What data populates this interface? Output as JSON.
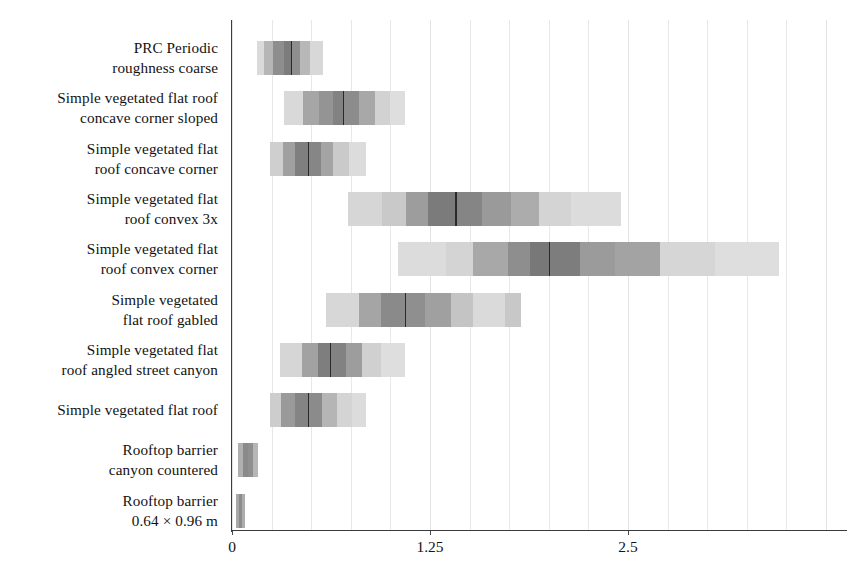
{
  "chart_data": {
    "type": "bar",
    "title": "",
    "xlabel": "",
    "ylabel": "",
    "orientation": "horizontal",
    "xlim": [
      -0.09,
      3.78
    ],
    "grid": true,
    "grid_axis": "x",
    "legend": "none",
    "xticks": [
      {
        "value": 0,
        "label": "0"
      },
      {
        "value": 1.25,
        "label": "1.25"
      },
      {
        "value": 2.5,
        "label": "2.5"
      }
    ],
    "minor_gridline_step": 0.25,
    "categories": [
      "PRC Periodic roughness coarse",
      "Simple vegetated flat roof concave corner sloped",
      "Simple vegetated flat roof concave corner",
      "Simple vegetated flat roof convex 3x",
      "Simple vegetated flat roof convex corner",
      "Simple vegetated flat roof gabled",
      "Simple vegetated flat roof angled street canyon",
      "Simple vegetated flat roof",
      "Rooftop barrier canyon countered",
      "Rooftop barrier 0.64 × 0.96 m"
    ],
    "category_labels": [
      {
        "line1": "PRC Periodic",
        "line2": "roughness coarse"
      },
      {
        "line1": "Simple vegetated flat roof",
        "line2": "concave corner sloped"
      },
      {
        "line1": "Simple vegetated flat",
        "line2": "roof concave corner"
      },
      {
        "line1": "Simple vegetated flat",
        "line2": "roof convex 3x"
      },
      {
        "line1": "Simple vegetated flat",
        "line2": "roof convex corner"
      },
      {
        "line1": "Simple vegetated",
        "line2": "flat roof gabled"
      },
      {
        "line1": "Simple vegetated flat",
        "line2": "roof angled street canyon"
      },
      {
        "line1": "Simple vegetated flat roof",
        "line2": ""
      },
      {
        "line1": "Rooftop barrier",
        "line2": "canyon countered"
      },
      {
        "line1": "Rooftop barrier",
        "line2": "0.64 × 0.96 m"
      }
    ],
    "series": [
      {
        "name": "density distribution",
        "rows": [
          {
            "category": "PRC Periodic roughness coarse",
            "min": 0.16,
            "max": 0.57,
            "median": 0.37,
            "bands": [
              {
                "from": 0.16,
                "to": 0.2,
                "shade": "#dadada"
              },
              {
                "from": 0.2,
                "to": 0.26,
                "shade": "#b6b6b6"
              },
              {
                "from": 0.26,
                "to": 0.33,
                "shade": "#8e8e8e"
              },
              {
                "from": 0.33,
                "to": 0.37,
                "shade": "#7c7c7c"
              },
              {
                "from": 0.37,
                "to": 0.43,
                "shade": "#8e8e8e"
              },
              {
                "from": 0.43,
                "to": 0.49,
                "shade": "#b8b8b8"
              },
              {
                "from": 0.49,
                "to": 0.57,
                "shade": "#d8d8d8"
              }
            ]
          },
          {
            "category": "Simple vegetated flat roof concave corner sloped",
            "min": 0.33,
            "max": 1.09,
            "median": 0.7,
            "bands": [
              {
                "from": 0.33,
                "to": 0.45,
                "shade": "#d9d9d9"
              },
              {
                "from": 0.45,
                "to": 0.55,
                "shade": "#a6a6a6"
              },
              {
                "from": 0.55,
                "to": 0.64,
                "shade": "#949494"
              },
              {
                "from": 0.64,
                "to": 0.7,
                "shade": "#828282"
              },
              {
                "from": 0.7,
                "to": 0.8,
                "shade": "#8c8c8c"
              },
              {
                "from": 0.8,
                "to": 0.9,
                "shade": "#a8a8a8"
              },
              {
                "from": 0.9,
                "to": 1.0,
                "shade": "#d2d2d2"
              },
              {
                "from": 1.0,
                "to": 1.09,
                "shade": "#dedede"
              }
            ]
          },
          {
            "category": "Simple vegetated flat roof concave corner",
            "min": 0.24,
            "max": 0.84,
            "median": 0.48,
            "bands": [
              {
                "from": 0.24,
                "to": 0.32,
                "shade": "#cfcfcf"
              },
              {
                "from": 0.32,
                "to": 0.4,
                "shade": "#a0a0a0"
              },
              {
                "from": 0.4,
                "to": 0.48,
                "shade": "#7f7f7f"
              },
              {
                "from": 0.48,
                "to": 0.56,
                "shade": "#868686"
              },
              {
                "from": 0.56,
                "to": 0.64,
                "shade": "#a4a4a4"
              },
              {
                "from": 0.64,
                "to": 0.74,
                "shade": "#cacaca"
              },
              {
                "from": 0.74,
                "to": 0.84,
                "shade": "#dcdcdc"
              }
            ]
          },
          {
            "category": "Simple vegetated flat roof convex 3x",
            "min": 0.73,
            "max": 2.45,
            "median": 1.41,
            "bands": [
              {
                "from": 0.73,
                "to": 0.95,
                "shade": "#d6d6d6"
              },
              {
                "from": 0.95,
                "to": 1.1,
                "shade": "#c9c9c9"
              },
              {
                "from": 1.1,
                "to": 1.24,
                "shade": "#9d9d9d"
              },
              {
                "from": 1.24,
                "to": 1.41,
                "shade": "#7b7b7b"
              },
              {
                "from": 1.41,
                "to": 1.58,
                "shade": "#858585"
              },
              {
                "from": 1.58,
                "to": 1.76,
                "shade": "#9a9a9a"
              },
              {
                "from": 1.76,
                "to": 1.94,
                "shade": "#acacac"
              },
              {
                "from": 1.94,
                "to": 2.14,
                "shade": "#d4d4d4"
              },
              {
                "from": 2.14,
                "to": 2.45,
                "shade": "#dcdcdc"
              }
            ]
          },
          {
            "category": "Simple vegetated flat roof convex corner",
            "min": 1.05,
            "max": 3.45,
            "median": 2.0,
            "bands": [
              {
                "from": 1.05,
                "to": 1.35,
                "shade": "#dcdcdc"
              },
              {
                "from": 1.35,
                "to": 1.52,
                "shade": "#d4d4d4"
              },
              {
                "from": 1.52,
                "to": 1.74,
                "shade": "#a8a8a8"
              },
              {
                "from": 1.74,
                "to": 1.88,
                "shade": "#8e8e8e"
              },
              {
                "from": 1.88,
                "to": 2.0,
                "shade": "#787878"
              },
              {
                "from": 2.0,
                "to": 2.2,
                "shade": "#7d7d7d"
              },
              {
                "from": 2.2,
                "to": 2.42,
                "shade": "#9b9b9b"
              },
              {
                "from": 2.42,
                "to": 2.7,
                "shade": "#a3a3a3"
              },
              {
                "from": 2.7,
                "to": 3.05,
                "shade": "#d6d6d6"
              },
              {
                "from": 3.05,
                "to": 3.45,
                "shade": "#dedede"
              }
            ]
          },
          {
            "category": "Simple vegetated flat roof gabled",
            "min": 0.59,
            "max": 1.82,
            "median": 1.09,
            "bands": [
              {
                "from": 0.59,
                "to": 0.8,
                "shade": "#d7d7d7"
              },
              {
                "from": 0.8,
                "to": 0.94,
                "shade": "#a5a5a5"
              },
              {
                "from": 0.94,
                "to": 1.09,
                "shade": "#8a8a8a"
              },
              {
                "from": 1.09,
                "to": 1.22,
                "shade": "#8f8f8f"
              },
              {
                "from": 1.22,
                "to": 1.38,
                "shade": "#a0a0a0"
              },
              {
                "from": 1.38,
                "to": 1.52,
                "shade": "#c4c4c4"
              },
              {
                "from": 1.52,
                "to": 1.72,
                "shade": "#dadada"
              },
              {
                "from": 1.72,
                "to": 1.82,
                "shade": "#c8c8c8"
              }
            ]
          },
          {
            "category": "Simple vegetated flat roof angled street canyon",
            "min": 0.3,
            "max": 1.09,
            "median": 0.62,
            "bands": [
              {
                "from": 0.3,
                "to": 0.44,
                "shade": "#d6d6d6"
              },
              {
                "from": 0.44,
                "to": 0.54,
                "shade": "#a2a2a2"
              },
              {
                "from": 0.54,
                "to": 0.62,
                "shade": "#7e7e7e"
              },
              {
                "from": 0.62,
                "to": 0.72,
                "shade": "#828282"
              },
              {
                "from": 0.72,
                "to": 0.82,
                "shade": "#9d9d9d"
              },
              {
                "from": 0.82,
                "to": 0.94,
                "shade": "#d0d0d0"
              },
              {
                "from": 0.94,
                "to": 1.09,
                "shade": "#dedede"
              }
            ]
          },
          {
            "category": "Simple vegetated flat roof",
            "min": 0.24,
            "max": 0.84,
            "median": 0.48,
            "bands": [
              {
                "from": 0.24,
                "to": 0.31,
                "shade": "#cdcdcd"
              },
              {
                "from": 0.31,
                "to": 0.4,
                "shade": "#9a9a9a"
              },
              {
                "from": 0.4,
                "to": 0.48,
                "shade": "#848484"
              },
              {
                "from": 0.48,
                "to": 0.57,
                "shade": "#8b8b8b"
              },
              {
                "from": 0.57,
                "to": 0.66,
                "shade": "#b5b5b5"
              },
              {
                "from": 0.66,
                "to": 0.76,
                "shade": "#d4d4d4"
              },
              {
                "from": 0.76,
                "to": 0.84,
                "shade": "#dcdcdc"
              }
            ]
          },
          {
            "category": "Rooftop barrier canyon countered",
            "min": 0.04,
            "max": 0.16,
            "median": 0.1,
            "bands": [
              {
                "from": 0.04,
                "to": 0.07,
                "shade": "#b0b0b0"
              },
              {
                "from": 0.07,
                "to": 0.1,
                "shade": "#8a8a8a"
              },
              {
                "from": 0.1,
                "to": 0.13,
                "shade": "#8f8f8f"
              },
              {
                "from": 0.13,
                "to": 0.16,
                "shade": "#b6b6b6"
              }
            ]
          },
          {
            "category": "Rooftop barrier 0.64 × 0.96 m",
            "min": 0.025,
            "max": 0.08,
            "median": 0.05,
            "bands": [
              {
                "from": 0.025,
                "to": 0.045,
                "shade": "#a8a8a8"
              },
              {
                "from": 0.045,
                "to": 0.06,
                "shade": "#8c8c8c"
              },
              {
                "from": 0.06,
                "to": 0.08,
                "shade": "#adadad"
              }
            ]
          }
        ]
      }
    ]
  },
  "axis": {
    "spine_color": "#3b3b3b",
    "grid_color": "#e8e8ea"
  }
}
